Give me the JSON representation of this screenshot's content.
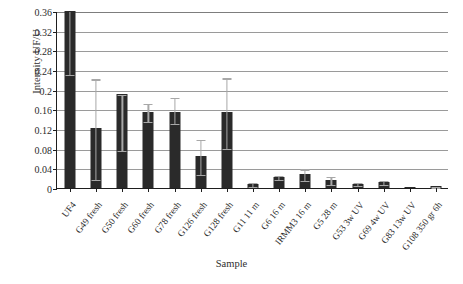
{
  "chart_data": {
    "type": "bar",
    "title": "",
    "xlabel": "Sample",
    "ylabel": "Intensity UF/U",
    "ylim": [
      0,
      0.36
    ],
    "yticks": [
      "0",
      "0.04",
      "0.08",
      "0.12",
      "0.16",
      "0.2",
      "0.24",
      "0.28",
      "0.32",
      "0.36"
    ],
    "ytick_values": [
      0,
      0.04,
      0.08,
      0.12,
      0.16,
      0.2,
      0.24,
      0.28,
      0.32,
      0.36
    ],
    "grid": true,
    "legend": "none",
    "categories": [
      "UF4",
      "G49 fresh",
      "G50 fresh",
      "G60 fresh",
      "G78 fresh",
      "G126 fresh",
      "G128 fresh",
      "G11 11 m",
      "G6 16 m",
      "IRMM3 16 m",
      "G5 28 m",
      "G53 3w UV",
      "G69 4w UV",
      "G83 13w UV",
      "G108 350 gr 6h"
    ],
    "values": [
      0.36,
      0.122,
      0.192,
      0.155,
      0.155,
      0.065,
      0.155,
      0.008,
      0.023,
      0.028,
      0.017,
      0.009,
      0.012,
      0.0,
      0.004
    ],
    "errors_low": [
      0.128,
      0.104,
      0.115,
      0.018,
      0.022,
      0.036,
      0.073,
      0.003,
      0.004,
      0.012,
      0.008,
      0.003,
      0.004,
      0.0,
      0.001
    ],
    "errors_high": [
      0.0,
      0.101,
      0.0,
      0.018,
      0.031,
      0.035,
      0.07,
      0.004,
      0.004,
      0.012,
      0.008,
      0.003,
      0.004,
      0.0,
      0.001
    ],
    "clipped_top": [
      true,
      false,
      false,
      false,
      false,
      false,
      false,
      false,
      false,
      false,
      false,
      false,
      false,
      false,
      false
    ],
    "bar_color": "#2a2a2a",
    "error_color": "#a8a8a8",
    "grid_color": "#9a9a9a",
    "axis_color": "#1e1e1e",
    "background": "#ffffff"
  }
}
